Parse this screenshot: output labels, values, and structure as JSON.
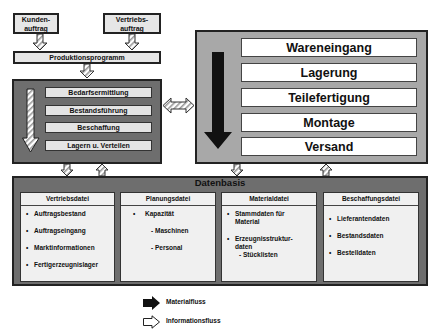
{
  "top_inputs": [
    {
      "label_line1": "Kunden-",
      "label_line2": "auftrag"
    },
    {
      "label_line1": "Vertriebs-",
      "label_line2": "auftrag"
    }
  ],
  "production_program": {
    "label": "Produktionsprogramm"
  },
  "planning_steps": [
    {
      "label": "Bedarfsermittlung"
    },
    {
      "label": "Bestandsführung"
    },
    {
      "label": "Beschaffung"
    },
    {
      "label": "Lagern u. Verteilen"
    }
  ],
  "material_steps": [
    {
      "label": "Wareneingang"
    },
    {
      "label": "Lagerung"
    },
    {
      "label": "Teilefertigung"
    },
    {
      "label": "Montage"
    },
    {
      "label": "Versand"
    }
  ],
  "datenbasis": {
    "title": "Datenbasis",
    "panels": [
      {
        "title": "Vertriebsdatei",
        "items": [
          "Auftragsbestand",
          "Auftragseingang",
          "Marktinformationen",
          "Fertigerzeugnislager"
        ]
      },
      {
        "title": "Planungsdatei",
        "items": [
          "Kapazität"
        ],
        "subitems": [
          "- Maschinen",
          "- Personal"
        ]
      },
      {
        "title": "Materialdatei",
        "items": [
          "Stammdaten für Material",
          "Erzeugnisstruktur-daten"
        ],
        "subitems": [
          "- Stücklisten"
        ]
      },
      {
        "title": "Beschaffungsdatei",
        "items": [
          "Lieferantendaten",
          "Bestandsdaten",
          "Bestelldaten"
        ]
      }
    ]
  },
  "legend": {
    "material_flow": "Materialfluss",
    "information_flow": "Informationsfluss"
  },
  "colors": {
    "dark_box": "#6e6e6e",
    "light_box": "#a8a8a8",
    "material_arrow": "#111111",
    "info_arrow": "#ffffff"
  }
}
